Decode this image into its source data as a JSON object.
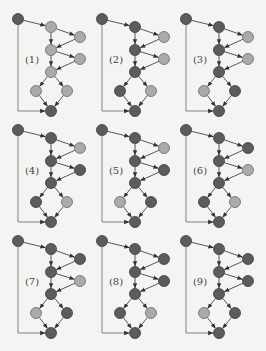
{
  "colors": {
    "background": "#f4f4f2",
    "dark_node": "#5c5c5c",
    "dark_stroke": "#3a3a3a",
    "light_node": "#aaaaaa",
    "light_stroke": "#6a6a6a",
    "edge": "#444444"
  },
  "graph": {
    "nodes": {
      "A": [
        18,
        19
      ],
      "B": [
        51,
        27
      ],
      "C": [
        80,
        37
      ],
      "D": [
        51,
        50
      ],
      "E": [
        80,
        59
      ],
      "F": [
        51,
        72
      ],
      "G": [
        36,
        91
      ],
      "H": [
        67,
        91
      ],
      "I": [
        51,
        111
      ]
    },
    "edges": [
      [
        "A",
        "B"
      ],
      [
        "B",
        "C"
      ],
      [
        "B",
        "D"
      ],
      [
        "C",
        "D"
      ],
      [
        "D",
        "E"
      ],
      [
        "D",
        "F"
      ],
      [
        "E",
        "F"
      ],
      [
        "F",
        "G"
      ],
      [
        "F",
        "H"
      ],
      [
        "G",
        "I"
      ],
      [
        "H",
        "I"
      ]
    ],
    "bypass_edge": [
      "A",
      "I"
    ],
    "label_pos": [
      32,
      63
    ]
  },
  "panels": [
    {
      "label": "(1)",
      "dx": 0,
      "dy": 0,
      "dark": [
        "A",
        "I"
      ]
    },
    {
      "label": "(2)",
      "dx": 84,
      "dy": 0,
      "dark": [
        "A",
        "B",
        "D",
        "F",
        "G",
        "I"
      ]
    },
    {
      "label": "(3)",
      "dx": 168,
      "dy": 0,
      "dark": [
        "A",
        "B",
        "D",
        "F",
        "H",
        "I"
      ]
    },
    {
      "label": "(4)",
      "dx": 0,
      "dy": 111,
      "dark": [
        "A",
        "B",
        "D",
        "E",
        "F",
        "G",
        "I"
      ]
    },
    {
      "label": "(5)",
      "dx": 84,
      "dy": 111,
      "dark": [
        "A",
        "B",
        "D",
        "E",
        "F",
        "H",
        "I"
      ]
    },
    {
      "label": "(6)",
      "dx": 168,
      "dy": 111,
      "dark": [
        "A",
        "B",
        "C",
        "D",
        "F",
        "G",
        "I"
      ]
    },
    {
      "label": "(7)",
      "dx": 0,
      "dy": 222,
      "dark": [
        "A",
        "B",
        "C",
        "D",
        "F",
        "H",
        "I"
      ]
    },
    {
      "label": "(8)",
      "dx": 84,
      "dy": 222,
      "dark": [
        "A",
        "B",
        "C",
        "D",
        "E",
        "F",
        "G",
        "I"
      ]
    },
    {
      "label": "(9)",
      "dx": 168,
      "dy": 222,
      "dark": [
        "A",
        "B",
        "C",
        "D",
        "E",
        "F",
        "H",
        "I"
      ]
    }
  ]
}
